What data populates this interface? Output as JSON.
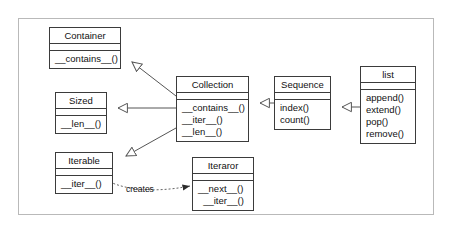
{
  "diagram": {
    "background": "#ffffff",
    "frame_color": "#b9b9b9",
    "line_color": "#555555",
    "box_border_color": "#3b3b3b",
    "text_color": "#111111"
  },
  "classes": {
    "container": {
      "name": "Container",
      "operations": [
        "__contains__()"
      ]
    },
    "sized": {
      "name": "Sized",
      "operations": [
        "__len__()"
      ]
    },
    "iterable": {
      "name": "Iterable",
      "operations": [
        "__iter__()"
      ]
    },
    "collection": {
      "name": "Collection",
      "operations": [
        "__contains__()",
        "__iter__()",
        "__len__()"
      ]
    },
    "sequence": {
      "name": "Sequence",
      "operations": [
        "index()",
        "count()"
      ]
    },
    "list": {
      "name": "list",
      "operations": [
        "append()",
        "extend()",
        "pop()",
        "remove()"
      ]
    },
    "iterator": {
      "name": "Iteraror",
      "operations": [
        "__next__()",
        "__iter__()"
      ]
    }
  },
  "relationships": {
    "generalizations": [
      {
        "from": "Collection",
        "to": "Container"
      },
      {
        "from": "Collection",
        "to": "Sized"
      },
      {
        "from": "Collection",
        "to": "Iterable"
      },
      {
        "from": "Sequence",
        "to": "Collection"
      },
      {
        "from": "list",
        "to": "Sequence"
      }
    ],
    "dependencies": [
      {
        "from": "Iterable",
        "to": "Iteraror",
        "label": "creates",
        "style": "dotted"
      }
    ]
  },
  "labels": {
    "creates": "creates"
  }
}
